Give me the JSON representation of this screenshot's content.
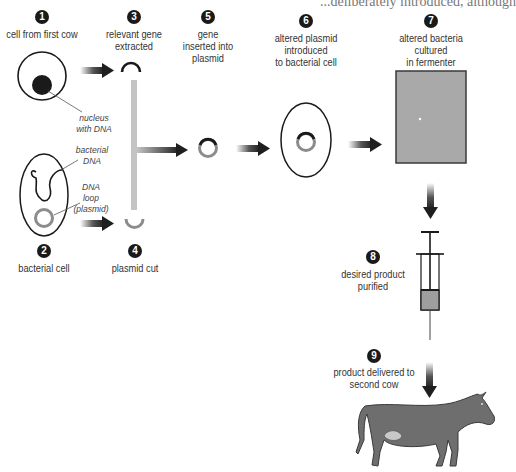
{
  "title_fragment": "...deliberately introduced, although",
  "colors": {
    "badge": "#1a1a1a",
    "arrow_dark": "#222222",
    "gene_bar": "#c4c4c4",
    "plasmid_ring": "#8c8c8c",
    "fermenter_fill": "#a9a9a9",
    "cow_fill": "#6e6e6e",
    "udder_fill": "#c8c8c8",
    "syringe_fill": "#9e9e9e"
  },
  "steps": [
    {
      "number": "1",
      "label_lines": [
        "cell from first cow"
      ]
    },
    {
      "number": "2",
      "label_lines": [
        "bacterial cell"
      ]
    },
    {
      "number": "3",
      "label_lines": [
        "relevant gene",
        "extracted"
      ]
    },
    {
      "number": "4",
      "label_lines": [
        "plasmid cut"
      ]
    },
    {
      "number": "5",
      "label_lines": [
        "gene",
        "inserted into",
        "plasmid"
      ]
    },
    {
      "number": "6",
      "label_lines": [
        "altered plasmid",
        "introduced",
        "to bacterial cell"
      ]
    },
    {
      "number": "7",
      "label_lines": [
        "altered bacteria",
        "cultured",
        "in fermenter"
      ]
    },
    {
      "number": "8",
      "label_lines": [
        "desired product",
        "purified"
      ]
    },
    {
      "number": "9",
      "label_lines": [
        "product delivered to",
        "second cow"
      ]
    }
  ],
  "annotations": {
    "nucleus": [
      "nucleus",
      "with DNA"
    ],
    "bacterial_dna": [
      "bacterial",
      "DNA"
    ],
    "plasmid": [
      "DNA",
      "loop",
      "(plasmid)"
    ]
  },
  "icons": [
    "cow-cell-icon",
    "nucleus-icon",
    "bacterial-cell-icon",
    "plasmid-icon",
    "gene-fragment-icon",
    "fermenter-icon",
    "syringe-icon",
    "cow-icon",
    "arrow-icon"
  ]
}
